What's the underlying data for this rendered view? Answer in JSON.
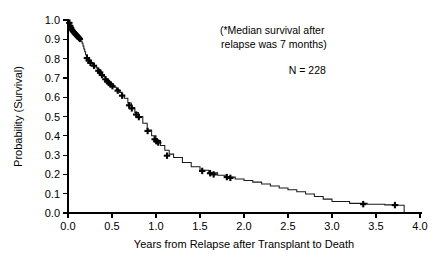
{
  "chart_data": {
    "type": "line",
    "title": "",
    "xlabel": "Years from Relapse after Transplant to Death",
    "ylabel": "Probability (Survival)",
    "xlim": [
      0.0,
      4.0
    ],
    "ylim": [
      0.0,
      1.0
    ],
    "grid": false,
    "legend": "none",
    "xticks": [
      "0.0",
      "0.5",
      "1.0",
      "1.5",
      "2.0",
      "2.5",
      "3.0",
      "3.5",
      "4.0"
    ],
    "xtick_values": [
      0.0,
      0.5,
      1.0,
      1.5,
      2.0,
      2.5,
      3.0,
      3.5,
      4.0
    ],
    "yticks": [
      "0.0",
      "0.1",
      "0.2",
      "0.3",
      "0.4",
      "0.5",
      "0.6",
      "0.7",
      "0.8",
      "0.9",
      "1.0"
    ],
    "ytick_values": [
      0.0,
      0.1,
      0.2,
      0.3,
      0.4,
      0.5,
      0.6,
      0.7,
      0.8,
      0.9,
      1.0
    ],
    "series": [
      {
        "name": "Survival after relapse",
        "step": true,
        "x": [
          0.0,
          0.02,
          0.03,
          0.04,
          0.05,
          0.06,
          0.07,
          0.08,
          0.09,
          0.1,
          0.11,
          0.12,
          0.13,
          0.14,
          0.15,
          0.16,
          0.17,
          0.18,
          0.19,
          0.2,
          0.22,
          0.24,
          0.26,
          0.28,
          0.3,
          0.32,
          0.34,
          0.36,
          0.38,
          0.4,
          0.43,
          0.46,
          0.49,
          0.52,
          0.55,
          0.58,
          0.61,
          0.64,
          0.68,
          0.72,
          0.76,
          0.8,
          0.85,
          0.9,
          0.95,
          1.0,
          1.05,
          1.1,
          1.15,
          1.2,
          1.3,
          1.4,
          1.5,
          1.6,
          1.7,
          1.8,
          1.9,
          2.0,
          2.1,
          2.2,
          2.3,
          2.4,
          2.5,
          2.6,
          2.7,
          2.8,
          2.9,
          3.0,
          3.2,
          3.4,
          3.6,
          3.75,
          3.82
        ],
        "y": [
          1.0,
          0.98,
          0.965,
          0.955,
          0.945,
          0.94,
          0.935,
          0.93,
          0.925,
          0.92,
          0.915,
          0.91,
          0.905,
          0.9,
          0.89,
          0.88,
          0.865,
          0.85,
          0.835,
          0.82,
          0.8,
          0.785,
          0.775,
          0.768,
          0.762,
          0.752,
          0.742,
          0.73,
          0.718,
          0.706,
          0.69,
          0.676,
          0.664,
          0.652,
          0.64,
          0.625,
          0.61,
          0.595,
          0.57,
          0.545,
          0.52,
          0.5,
          0.465,
          0.43,
          0.4,
          0.375,
          0.35,
          0.325,
          0.305,
          0.288,
          0.262,
          0.24,
          0.222,
          0.208,
          0.196,
          0.186,
          0.176,
          0.168,
          0.16,
          0.15,
          0.14,
          0.13,
          0.12,
          0.11,
          0.098,
          0.085,
          0.072,
          0.06,
          0.05,
          0.045,
          0.042,
          0.04,
          0.0
        ]
      }
    ],
    "censored_points": [
      {
        "x": 0.015,
        "y": 0.985
      },
      {
        "x": 0.025,
        "y": 0.97
      },
      {
        "x": 0.035,
        "y": 0.96
      },
      {
        "x": 0.045,
        "y": 0.95
      },
      {
        "x": 0.055,
        "y": 0.942
      },
      {
        "x": 0.065,
        "y": 0.937
      },
      {
        "x": 0.075,
        "y": 0.932
      },
      {
        "x": 0.085,
        "y": 0.927
      },
      {
        "x": 0.095,
        "y": 0.922
      },
      {
        "x": 0.105,
        "y": 0.917
      },
      {
        "x": 0.115,
        "y": 0.912
      },
      {
        "x": 0.125,
        "y": 0.907
      },
      {
        "x": 0.135,
        "y": 0.902
      },
      {
        "x": 0.215,
        "y": 0.803
      },
      {
        "x": 0.235,
        "y": 0.79
      },
      {
        "x": 0.255,
        "y": 0.778
      },
      {
        "x": 0.295,
        "y": 0.763
      },
      {
        "x": 0.345,
        "y": 0.737
      },
      {
        "x": 0.365,
        "y": 0.728
      },
      {
        "x": 0.385,
        "y": 0.715
      },
      {
        "x": 0.425,
        "y": 0.693
      },
      {
        "x": 0.445,
        "y": 0.682
      },
      {
        "x": 0.465,
        "y": 0.674
      },
      {
        "x": 0.485,
        "y": 0.666
      },
      {
        "x": 0.505,
        "y": 0.657
      },
      {
        "x": 0.565,
        "y": 0.634
      },
      {
        "x": 0.615,
        "y": 0.608
      },
      {
        "x": 0.695,
        "y": 0.558
      },
      {
        "x": 0.725,
        "y": 0.542
      },
      {
        "x": 0.775,
        "y": 0.51
      },
      {
        "x": 0.805,
        "y": 0.497
      },
      {
        "x": 0.905,
        "y": 0.425
      },
      {
        "x": 0.985,
        "y": 0.382
      },
      {
        "x": 1.005,
        "y": 0.372
      },
      {
        "x": 1.025,
        "y": 0.365
      },
      {
        "x": 1.125,
        "y": 0.297
      },
      {
        "x": 1.525,
        "y": 0.218
      },
      {
        "x": 1.615,
        "y": 0.206
      },
      {
        "x": 1.655,
        "y": 0.2
      },
      {
        "x": 1.805,
        "y": 0.186
      },
      {
        "x": 1.845,
        "y": 0.182
      },
      {
        "x": 3.355,
        "y": 0.046
      },
      {
        "x": 3.715,
        "y": 0.041
      }
    ],
    "annotations": [
      {
        "name": "median-survival-note-line1",
        "text": "(*Median survival after",
        "x": 2.32,
        "y": 0.925
      },
      {
        "name": "median-survival-note-line2",
        "text": "relapse was 7 months)",
        "x": 2.34,
        "y": 0.855
      },
      {
        "name": "sample-size-note",
        "text": "N = 228",
        "x": 2.72,
        "y": 0.72
      }
    ]
  },
  "colors": {
    "curve": "#1a1a1a",
    "axis": "#000000",
    "text": "#000000",
    "background": "#ffffff"
  }
}
